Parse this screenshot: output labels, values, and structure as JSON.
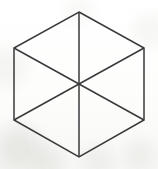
{
  "figure": {
    "name": "hexagon-with-diagonals",
    "canvas": {
      "width": 158,
      "height": 169
    },
    "background_color": "#fcfcfb",
    "line_color": "#3a3a3c",
    "line_width": 1.5,
    "fill_color": "none",
    "center": {
      "x": 79,
      "y": 84.5
    },
    "vertices": [
      {
        "label": "top",
        "x": 79,
        "y": 12
      },
      {
        "label": "upper-right",
        "x": 144,
        "y": 48
      },
      {
        "label": "lower-right",
        "x": 144,
        "y": 120
      },
      {
        "label": "bottom",
        "x": 79,
        "y": 157
      },
      {
        "label": "lower-left",
        "x": 14,
        "y": 120
      },
      {
        "label": "upper-left",
        "x": 14,
        "y": 48
      }
    ],
    "outline_points": "79,12 144,48 144,120 79,157 14,120 14,48",
    "diagonals": [
      {
        "label": "vertical-diagonal",
        "x1": 79,
        "y1": 12,
        "x2": 79,
        "y2": 157
      },
      {
        "label": "upper-left-to-lower-right-diagonal",
        "x1": 14,
        "y1": 48,
        "x2": 144,
        "y2": 120
      },
      {
        "label": "upper-right-to-lower-left-diagonal",
        "x1": 144,
        "y1": 48,
        "x2": 14,
        "y2": 120
      }
    ],
    "triangle_count": 6,
    "labels": []
  }
}
